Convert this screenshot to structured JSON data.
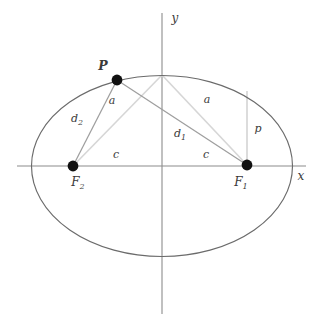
{
  "figure": {
    "type": "geometry-diagram"
  },
  "axes": {
    "x_label": "x",
    "y_label": "y",
    "color": "#8c8c8c"
  },
  "curve": {
    "name": "ellipse",
    "color": "#6b6b6b",
    "center": {
      "x": 162,
      "y": 166
    },
    "semi_major_a": 130,
    "semi_minor_b": 91
  },
  "points": [
    {
      "id": "P",
      "label": "P",
      "label_sub": "",
      "x": 117,
      "y": 80,
      "label_x": 103,
      "label_y": 69,
      "style": "bold"
    },
    {
      "id": "F1",
      "label": "F",
      "label_sub": "1",
      "x": 247,
      "y": 165,
      "label_x": 241,
      "label_y": 181,
      "style": "normal"
    },
    {
      "id": "F2",
      "label": "F",
      "label_sub": "2",
      "x": 73,
      "y": 166,
      "label_x": 67,
      "label_y": 181,
      "style": "normal"
    }
  ],
  "segments": [
    {
      "id": "a-left",
      "label": "a",
      "label_sub": "",
      "label_x": 109,
      "label_y": 104,
      "color": "#d0d0d0",
      "from": "top-vertex",
      "to": "F2"
    },
    {
      "id": "a-right",
      "label": "a",
      "label_sub": "",
      "label_x": 204,
      "label_y": 103,
      "color": "#d0d0d0",
      "from": "top-vertex",
      "to": "F1"
    },
    {
      "id": "d1",
      "label": "d",
      "label_sub": "1",
      "label_x": 178,
      "label_y": 137,
      "color": "#9a9a9a",
      "from": "P",
      "to": "F1"
    },
    {
      "id": "d2",
      "label": "d",
      "label_sub": "2",
      "label_x": 74,
      "label_y": 122,
      "color": "#9a9a9a",
      "from": "P",
      "to": "F2"
    },
    {
      "id": "c-left",
      "label": "c",
      "label_sub": "",
      "label_x": 113,
      "label_y": 158,
      "color": "none",
      "from": "origin",
      "to": "F2"
    },
    {
      "id": "c-right",
      "label": "c",
      "label_sub": "",
      "label_x": 203,
      "label_y": 158,
      "color": "none",
      "from": "origin",
      "to": "F1"
    },
    {
      "id": "p",
      "label": "p",
      "label_sub": "",
      "label_x": 254,
      "label_y": 132,
      "color": "#c4c4c4",
      "from": "F1",
      "to": "ellipse-above-F1"
    }
  ],
  "colors": {
    "background": "#ffffff",
    "curve": "#6b6b6b",
    "axis": "#8c8c8c",
    "light_line": "#d3d3d3",
    "mid_line": "#9a9a9a",
    "point_fill": "#111111",
    "text": "#3a3a3a"
  }
}
